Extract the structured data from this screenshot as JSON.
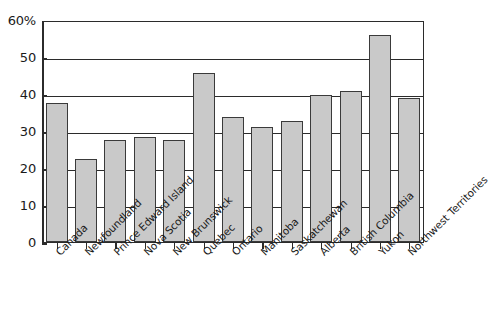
{
  "chart_data": {
    "type": "bar",
    "title": "",
    "xlabel": "",
    "ylabel": "",
    "ylim": [
      0,
      60
    ],
    "ytick_values": [
      0,
      10,
      20,
      30,
      40,
      50,
      60
    ],
    "ytick_labels": [
      "0",
      "10",
      "20",
      "30",
      "40",
      "50",
      "60%"
    ],
    "grid": true,
    "legend": "none",
    "categories": [
      "Canada",
      "Newfoundland",
      "Prince Edward Island",
      "Nova Scotia",
      "New Brunswick",
      "Quebec",
      "Ontario",
      "Manitoba",
      "Saskatchewan",
      "Alberta",
      "British Columbia",
      "Yukon",
      "Northwest Territories"
    ],
    "values": [
      37.5,
      22.5,
      27.7,
      28.5,
      27.7,
      45.7,
      33.8,
      31.2,
      32.6,
      39.8,
      40.8,
      56.0,
      39.0
    ],
    "bar_fill_color": "#c9c9c9",
    "bar_border_color": "#3a3a3a",
    "axis_color": "#2b2b2b",
    "background_color": "#ffffff"
  }
}
